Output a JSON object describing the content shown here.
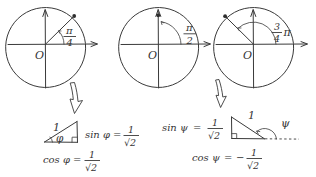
{
  "figure": {
    "title_text": "",
    "ink_color": "#3a3a3a",
    "background_color": "#ffffff",
    "style": "hand-drawn pencil sketch"
  },
  "circles": [
    {
      "id": "circle-pi-over-4",
      "origin_label": "O",
      "angle_numerator": "π",
      "angle_denominator": "4",
      "angle_suffix": "",
      "angle_degrees": 45,
      "point_marked": true
    },
    {
      "id": "circle-pi-over-2",
      "origin_label": "O",
      "angle_numerator": "π",
      "angle_denominator": "2",
      "angle_suffix": "",
      "angle_degrees": 90,
      "point_marked": true
    },
    {
      "id": "circle-three-pi-over-4",
      "origin_label": "O",
      "angle_numerator": "3",
      "angle_denominator": "4",
      "angle_suffix": "π",
      "angle_degrees": 135,
      "point_marked": true
    }
  ],
  "derivations": [
    {
      "id": "phi-derivation",
      "triangle": {
        "hypotenuse_label": "1",
        "angle_label": "φ",
        "right_angle_mark": true
      },
      "sin": {
        "lhs": "sin φ",
        "equals": "=",
        "sign": "",
        "numerator": "1",
        "denominator": "√2"
      },
      "cos": {
        "lhs": "cos φ",
        "equals": "=",
        "sign": "",
        "numerator": "1",
        "denominator": "√2"
      }
    },
    {
      "id": "psi-derivation",
      "triangle": {
        "hypotenuse_label": "1",
        "angle_label": "ψ",
        "right_angle_mark": true,
        "dashed_extension": true
      },
      "sin": {
        "lhs": "sin ψ",
        "equals": "=",
        "sign": "",
        "numerator": "1",
        "denominator": "√2"
      },
      "cos": {
        "lhs": "cos ψ",
        "equals": "=",
        "sign": "−",
        "numerator": "1",
        "denominator": "√2"
      }
    }
  ],
  "arrows": [
    {
      "id": "arrow-left",
      "direction": "down",
      "style": "hollow-outline"
    },
    {
      "id": "arrow-right",
      "direction": "down",
      "style": "hollow-outline"
    }
  ]
}
